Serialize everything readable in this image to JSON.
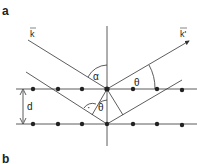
{
  "panels": [
    {
      "label": "a"
    },
    {
      "label": "b"
    }
  ],
  "diagram": {
    "labels": {
      "incident_wavevector": "k",
      "scattered_wavevector": "k'",
      "angle_alpha": "α",
      "angle_theta_top": "θ",
      "angle_theta_inner": "θ",
      "plane_spacing": "d",
      "right_angle_dot": "·"
    },
    "lattice": {
      "rows": 2,
      "top_row_y": 89,
      "bottom_row_y": 124,
      "atom_x": [
        33,
        58,
        82,
        107,
        133,
        157,
        182
      ]
    },
    "colors": {
      "line": "#333333",
      "atom": "#222222",
      "background": "#ffffff"
    }
  }
}
